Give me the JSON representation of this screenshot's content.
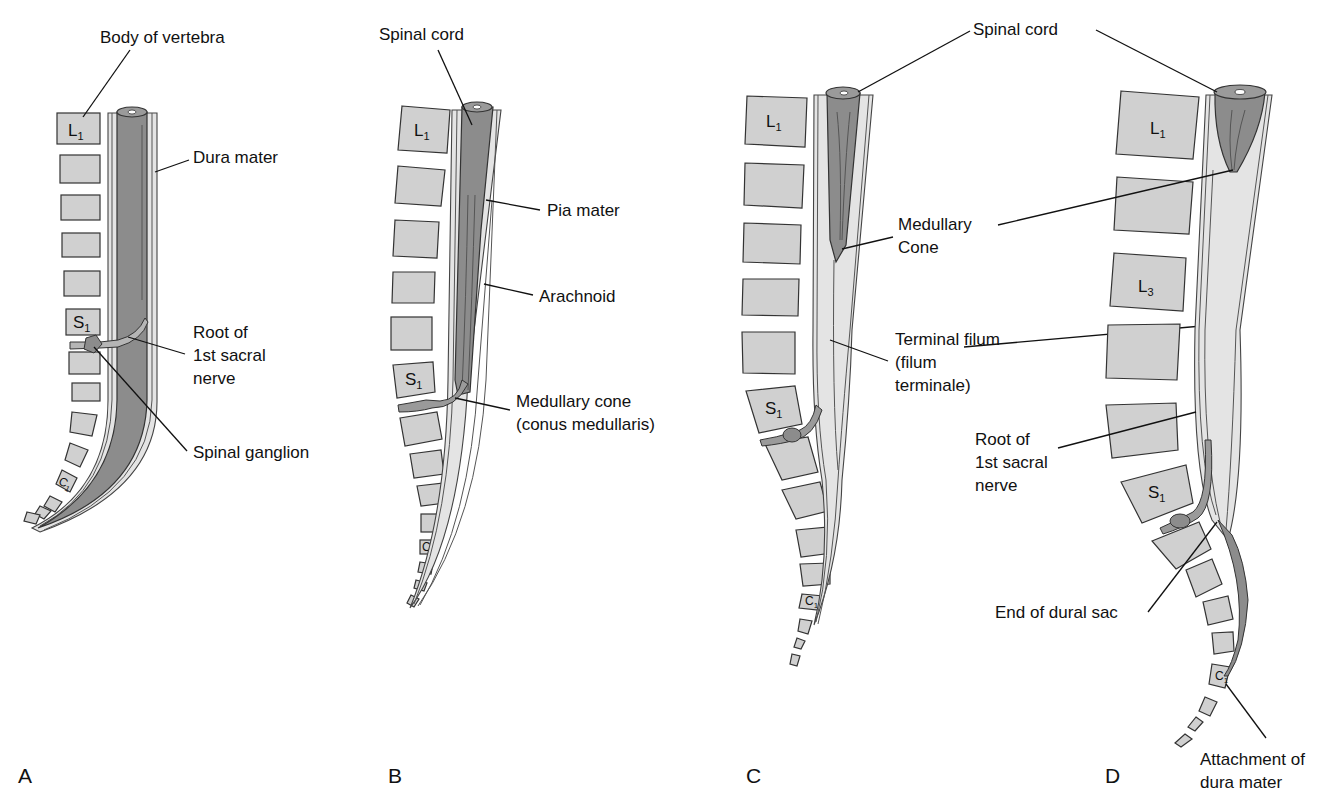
{
  "figure": {
    "panels": [
      {
        "id": "A",
        "letter": "A",
        "vertebra_labels": {
          "L1": "L",
          "L1_sub": "1",
          "S1": "S",
          "S1_sub": "1",
          "C1": "C",
          "C1_sub": "1"
        },
        "labels": [
          "Body of vertebra",
          "Dura mater",
          "Root of",
          "1st sacral",
          "nerve",
          "Spinal ganglion"
        ]
      },
      {
        "id": "B",
        "letter": "B",
        "vertebra_labels": {
          "L1": "L",
          "L1_sub": "1",
          "S1": "S",
          "S1_sub": "1",
          "C1": "C",
          "C1_sub": "1"
        },
        "labels": [
          "Spinal cord",
          "Pia mater",
          "Arachnoid",
          "Medullary cone",
          "(conus medullaris)"
        ]
      },
      {
        "id": "C",
        "letter": "C",
        "vertebra_labels": {
          "L1": "L",
          "L1_sub": "1",
          "S1": "S",
          "S1_sub": "1",
          "C1": "C",
          "C1_sub": "1"
        },
        "labels": [
          "Medullary",
          "Cone",
          "Terminal filum",
          "(filum",
          "terminale)"
        ]
      },
      {
        "id": "D",
        "letter": "D",
        "vertebra_labels": {
          "L1": "L",
          "L1_sub": "1",
          "L3": "L",
          "L3_sub": "3",
          "S1": "S",
          "S1_sub": "1",
          "C1": "C",
          "C1_sub": "1"
        },
        "labels": [
          "Root of",
          "1st sacral",
          "nerve",
          "End of dural sac",
          "Attachment of",
          "dura mater"
        ]
      }
    ],
    "shared_labels": {
      "spinal_cord_cd": "Spinal cord"
    },
    "colors": {
      "vertebra_fill": "#d0d0d0",
      "cord_fill": "#8c8c8c",
      "sheath_fill": "#e4e4e4",
      "outline": "#333333",
      "text": "#111111"
    }
  }
}
